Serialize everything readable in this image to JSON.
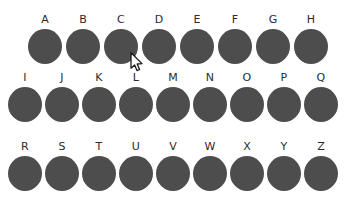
{
  "canvas": {
    "width": 354,
    "height": 206,
    "background_color": "#ffffff"
  },
  "style": {
    "dot_color": "#4d4d4d",
    "label_color": "#2b2b2b",
    "dot_diameter_px": 34
  },
  "rows": [
    {
      "name": "row-1",
      "top": 14,
      "left": 28,
      "gap": 4,
      "items": [
        {
          "label": "A"
        },
        {
          "label": "B"
        },
        {
          "label": "C"
        },
        {
          "label": "D"
        },
        {
          "label": "E"
        },
        {
          "label": "F"
        },
        {
          "label": "G"
        },
        {
          "label": "H"
        }
      ]
    },
    {
      "name": "row-2",
      "top": 72,
      "left": 8,
      "gap": 3,
      "items": [
        {
          "label": "I"
        },
        {
          "label": "J"
        },
        {
          "label": "K"
        },
        {
          "label": "L"
        },
        {
          "label": "M"
        },
        {
          "label": "N"
        },
        {
          "label": "O"
        },
        {
          "label": "P"
        },
        {
          "label": "Q"
        }
      ]
    },
    {
      "name": "row-3",
      "top": 141,
      "left": 8,
      "gap": 3,
      "items": [
        {
          "label": "R"
        },
        {
          "label": "S"
        },
        {
          "label": "T"
        },
        {
          "label": "U"
        },
        {
          "label": "V"
        },
        {
          "label": "W"
        },
        {
          "label": "X"
        },
        {
          "label": "Y"
        },
        {
          "label": "Z"
        }
      ]
    }
  ],
  "cursor": {
    "name": "mouse-pointer",
    "x": 130,
    "y": 52,
    "fill": "#ffffff",
    "outline": "#1a1a1a"
  }
}
